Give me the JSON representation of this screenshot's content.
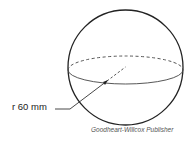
{
  "figure": {
    "shape": "sphere",
    "radius_label": "r 60 mm",
    "credit": "Goodheart-Willcox Publisher",
    "colors": {
      "stroke": "#222222",
      "background": "#ffffff"
    }
  }
}
